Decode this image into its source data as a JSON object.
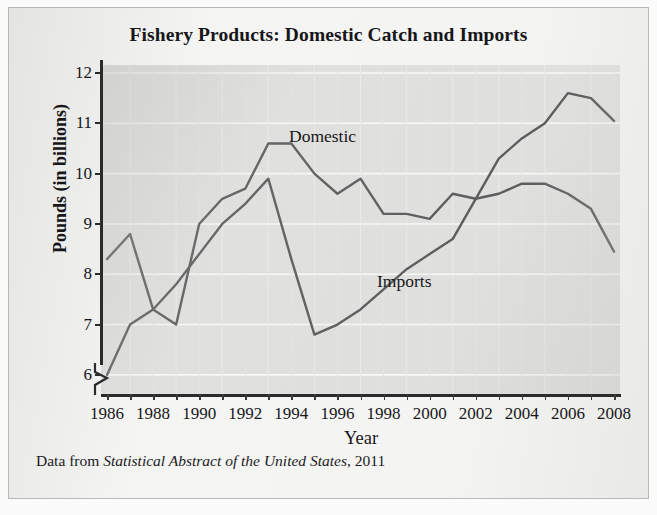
{
  "figure": {
    "title": "Fishery Products: Domestic Catch and Imports",
    "source_prefix": "Data from",
    "source_italic": "Statistical Abstract of the United States",
    "source_suffix": ", 2011"
  },
  "axes": {
    "x_title": "Year",
    "y_title": "Pounds (in billions)",
    "y_ticks": [
      "12",
      "11",
      "10",
      "9",
      "8",
      "7",
      "6"
    ],
    "x_ticks": [
      "1986",
      "1988",
      "1990",
      "1992",
      "1994",
      "1996",
      "1998",
      "2000",
      "2002",
      "2004",
      "2006",
      "2008"
    ],
    "y_break_note": "axis-break"
  },
  "series_labels": {
    "domestic": "Domestic",
    "imports": "Imports"
  },
  "colors": {
    "line": "#4a4a4d",
    "plot_background": "#dfdfdd",
    "gridline": "#fbfbfa",
    "page_background": "#f4f4f2",
    "text": "#17171a"
  },
  "chart_data": {
    "type": "line",
    "title": "Fishery Products: Domestic Catch and Imports",
    "xlabel": "Year",
    "ylabel": "Pounds (in billions)",
    "xlim": [
      1986,
      2008
    ],
    "ylim": [
      5.6,
      12
    ],
    "y_axis_break": true,
    "grid": true,
    "legend": "inline-labels",
    "x": [
      1986,
      1987,
      1988,
      1989,
      1990,
      1991,
      1992,
      1993,
      1994,
      1995,
      1996,
      1997,
      1998,
      1999,
      2000,
      2001,
      2002,
      2003,
      2004,
      2005,
      2006,
      2007,
      2008
    ],
    "series": [
      {
        "name": "Domestic",
        "values": [
          8.3,
          8.8,
          7.3,
          7.0,
          9.0,
          9.5,
          9.7,
          10.6,
          10.6,
          10.0,
          9.6,
          9.9,
          9.2,
          9.2,
          9.1,
          9.6,
          9.5,
          9.6,
          9.8,
          9.8,
          9.6,
          9.3,
          8.45
        ]
      },
      {
        "name": "Imports",
        "values": [
          6.0,
          7.0,
          7.3,
          7.8,
          8.4,
          9.0,
          9.4,
          9.9,
          8.3,
          6.8,
          7.0,
          7.3,
          7.7,
          8.1,
          8.4,
          8.7,
          9.5,
          10.3,
          10.7,
          11.0,
          11.6,
          11.5,
          11.05
        ]
      }
    ]
  }
}
